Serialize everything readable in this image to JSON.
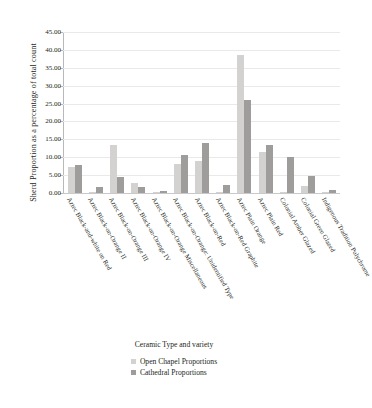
{
  "chart_data": {
    "type": "bar",
    "title": "",
    "xlabel": "",
    "ylabel": "Sherd Proportion as a percentage of total count",
    "ylim": [
      0,
      45
    ],
    "ytick_step": 5,
    "ytick_labels": [
      "0.00",
      "5.00",
      "10.00",
      "15.00",
      "20.00",
      "25.00",
      "30.00",
      "35.00",
      "40.00",
      "45.00"
    ],
    "grid": true,
    "legend_position": "bottom",
    "legend_title": "Ceramic Type and variety",
    "categories": [
      "Aztec Black-and-white on Red",
      "Aztec Black-on-Orange II",
      "Aztec Black-on-Orange III",
      "Aztec Black-on-Orange IV",
      "Aztec Black-on-Orange Miscellaneous",
      "Aztec Black-on-Orange: Unidentified Type",
      "Aztec Black-on-Red",
      "Aztec Black-on-Red Graphite",
      "Aztec Plain Orange",
      "Aztec Plain Red",
      "Colonial Amber Glazed",
      "Colonial Green Glazed",
      "Indigenous Tradition Polychrome"
    ],
    "series": [
      {
        "name": "Open Chapel Proportions",
        "color": "#d4d2d0",
        "values": [
          7.3,
          0.3,
          13.5,
          2.9,
          0.2,
          8.0,
          8.9,
          0.1,
          38.6,
          11.5,
          0.4,
          2.1,
          0.1
        ]
      },
      {
        "name": "Cathedral Proportions",
        "color": "#9f9d9b",
        "values": [
          7.8,
          1.7,
          4.4,
          1.7,
          0.6,
          10.7,
          14.0,
          2.2,
          25.9,
          13.5,
          10.1,
          4.7,
          0.9
        ]
      }
    ]
  }
}
